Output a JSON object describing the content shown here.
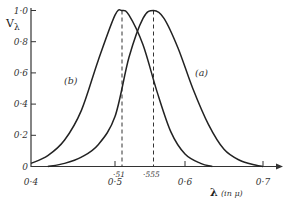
{
  "chart_data": {
    "type": "line",
    "title": "",
    "xlabel": "λ (in μ)",
    "ylabel": "Vλ",
    "xlim": [
      0.4,
      0.72
    ],
    "ylim": [
      0,
      1.0
    ],
    "grid": false,
    "legend": "inline curve labels",
    "x_ticks": [
      "0·4",
      "0·5",
      "0·6",
      "0·7"
    ],
    "y_ticks": [
      "0",
      "0·2",
      "0·4",
      "0·6",
      "0·8",
      "1·0"
    ],
    "annotations": [
      {
        "text": "·51",
        "x": 0.51,
        "type": "dashed vertical at peak of (b)"
      },
      {
        "text": "·555",
        "x": 0.555,
        "type": "dashed vertical at peak of (a)"
      }
    ],
    "series": [
      {
        "name": "(a)",
        "x": [
          0.42,
          0.44,
          0.46,
          0.48,
          0.5,
          0.52,
          0.54,
          0.555,
          0.57,
          0.59,
          0.61,
          0.63,
          0.65,
          0.67,
          0.69,
          0.7
        ],
        "y": [
          0.0,
          0.02,
          0.06,
          0.14,
          0.32,
          0.7,
          0.95,
          1.0,
          0.95,
          0.76,
          0.5,
          0.27,
          0.11,
          0.04,
          0.01,
          0.0
        ]
      },
      {
        "name": "(b)",
        "x": [
          0.4,
          0.42,
          0.44,
          0.46,
          0.48,
          0.5,
          0.51,
          0.52,
          0.54,
          0.56,
          0.58,
          0.6,
          0.62,
          0.635
        ],
        "y": [
          0.02,
          0.07,
          0.17,
          0.36,
          0.68,
          0.97,
          1.0,
          0.97,
          0.78,
          0.48,
          0.22,
          0.08,
          0.02,
          0.0
        ]
      }
    ]
  },
  "labels": {
    "y_axis": "V",
    "y_axis_sub": "λ",
    "x_axis": "λ",
    "x_unit": "(in μ)",
    "curve_a": "(a)",
    "curve_b": "(b)",
    "peak_b": "·51",
    "peak_a": "·555",
    "x_ticks": [
      "0·4",
      "0·5",
      "0·6",
      "0·7"
    ],
    "y_ticks": [
      "0",
      "0·2",
      "0·4",
      "0·6",
      "0·8",
      "1·0"
    ]
  }
}
